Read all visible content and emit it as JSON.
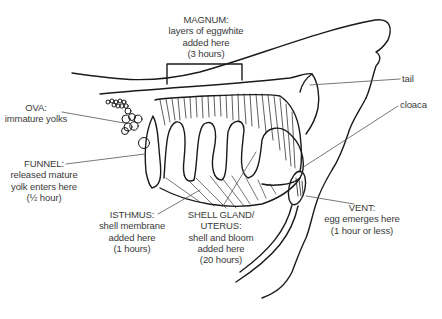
{
  "diagram": {
    "labels": {
      "magnum": {
        "name": "MAGNUM:",
        "lines": [
          "layers of eggwhite",
          "added here",
          "(3 hours)"
        ]
      },
      "tail": {
        "name": "tail"
      },
      "cloaca": {
        "name": "cloaca"
      },
      "ova": {
        "name": "OVA:",
        "lines": [
          "immature yolks"
        ]
      },
      "funnel": {
        "name": "FUNNEL:",
        "lines": [
          "released mature",
          "yolk enters here",
          "(½ hour)"
        ]
      },
      "isthmus": {
        "name": "ISTHMUS:",
        "lines": [
          "shell membrane",
          "added here",
          "(1 hours)"
        ]
      },
      "shell_gland": {
        "name": "SHELL GLAND/",
        "lines": [
          "UTERUS:",
          "shell and bloom",
          "added here",
          "(20 hours)"
        ]
      },
      "vent": {
        "name": "VENT:",
        "lines": [
          "egg emerges here",
          "(1 hour or less)"
        ]
      }
    },
    "colors": {
      "line": "#1a1a1a",
      "leader": "#555555",
      "text": "#3a3a3a"
    }
  }
}
